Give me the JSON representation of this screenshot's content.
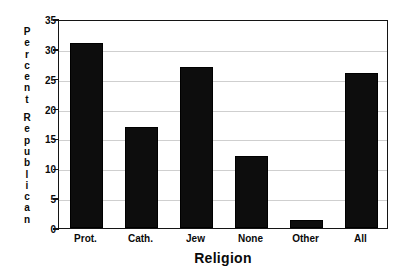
{
  "chart_data": {
    "type": "bar",
    "title": "",
    "subtitle": "",
    "xlabel": "Religion",
    "ylabel": "Percent Republican",
    "ylabel_letters": [
      "P",
      "e",
      "r",
      "c",
      "e",
      "n",
      "t",
      "",
      "R",
      "e",
      "p",
      "u",
      "b",
      "l",
      "i",
      "c",
      "a",
      "n"
    ],
    "categories": [
      "Prot.",
      "Cath.",
      "Jew",
      "None",
      "Other",
      "All"
    ],
    "values": [
      31,
      17,
      27,
      12,
      1.3,
      26
    ],
    "ylim": [
      0,
      35
    ],
    "yticks": [
      0,
      5,
      10,
      15,
      20,
      25,
      30,
      35
    ],
    "ytick_labels": [
      "0",
      "5",
      "10",
      "15",
      "20",
      "25",
      "30",
      "35"
    ],
    "grid": "horizontal",
    "legend": "none",
    "bar_color": "#0d0d0d",
    "grid_color": "#cfcfcf",
    "axis_color": "#141414",
    "text_color": "#0a0a0a",
    "background": "#ffffff"
  }
}
